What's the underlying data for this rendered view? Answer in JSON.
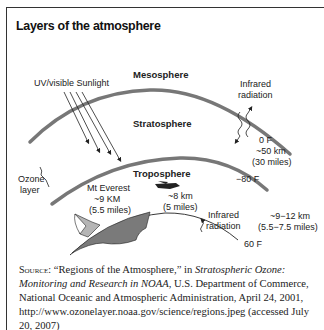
{
  "figure": {
    "title": "Layers of the atmosphere"
  },
  "diagram": {
    "sunlight_label": "UV/visible Sunlight",
    "layers": {
      "mesosphere": "Mesosphere",
      "stratosphere": "Stratosphere",
      "troposphere": "Troposphere"
    },
    "ozone_label_line1": "Ozone",
    "ozone_label_line2": "layer",
    "infrared_upper_line1": "Infrared",
    "infrared_upper_line2": "radiation",
    "infrared_lower_line1": "Infrared",
    "infrared_lower_line2": "radiation",
    "stratopause": {
      "temp": "0  F",
      "altitude": "~50 km",
      "miles": "(30 miles)"
    },
    "tropopause": {
      "temp": "−80  F",
      "altitude": "~9−12 km",
      "miles": "(5.5−7.5 miles)"
    },
    "surface": {
      "temp": "60  F"
    },
    "everest": {
      "name": "Mt Everest",
      "altitude": "~9 KM",
      "miles": "(5.5 miles)"
    },
    "airplane": {
      "altitude": "~8 km",
      "miles": "(5 miles)"
    }
  },
  "source": {
    "prefix": "Source:",
    "text1": " “Regions of the Atmosphere,” in ",
    "italic": "Stratospheric Ozone: Monitoring and Research in NOAA",
    "text2": ", U.S. Department of Commerce, National Oceanic and Atmospheric Administration, April 24, 2001, http://www.ozonelayer.noaa.gov/science/regions.jpeg (accessed July 20, 2007)"
  },
  "colors": {
    "layer_line": "#777777",
    "mountain_dark": "#7a7a7a",
    "mountain_mid": "#b5b5b5",
    "text": "#222222"
  }
}
